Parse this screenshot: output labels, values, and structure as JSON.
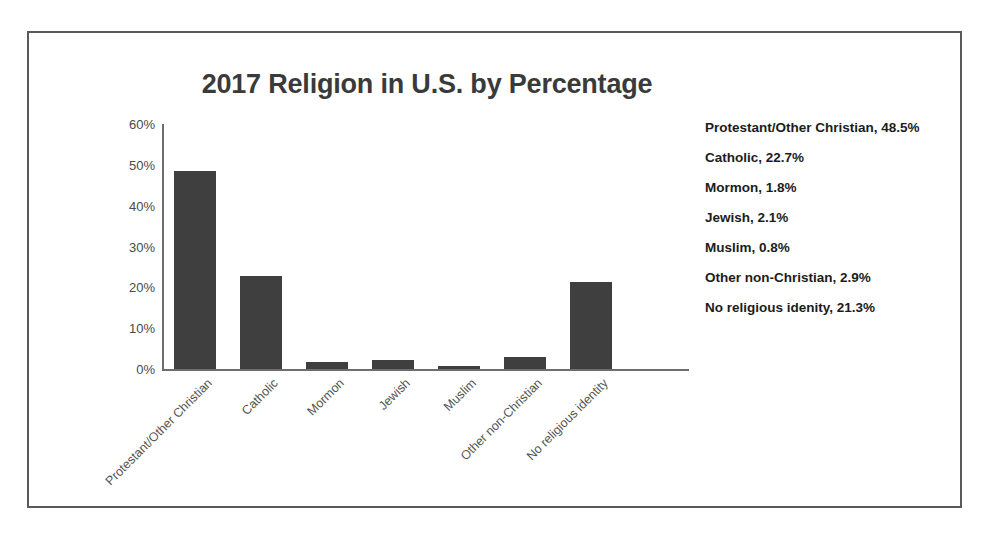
{
  "chart_data": {
    "type": "bar",
    "title": "2017 Religion in U.S. by Percentage",
    "xlabel": "",
    "ylabel": "",
    "ylim": [
      0,
      60
    ],
    "ytick_labels": [
      "60%",
      "50%",
      "40%",
      "30%",
      "20%",
      "10%",
      "0%"
    ],
    "ytick_values": [
      60,
      50,
      40,
      30,
      20,
      10,
      0
    ],
    "grid": false,
    "legend_position": "right",
    "bar_color": "#3f3f3f",
    "axis_color": "#6d6d6d",
    "categories": [
      "Protestant/Other Christian",
      "Catholic",
      "Mormon",
      "Jewish",
      "Muslim",
      "Other non-Christian",
      "No religious identity"
    ],
    "values": [
      48.5,
      22.7,
      1.8,
      2.1,
      0.8,
      2.9,
      21.3
    ],
    "value_suffix": "%"
  },
  "legend": {
    "entries": [
      "Protestant/Other Christian, 48.5%",
      "Catholic, 22.7%",
      "Mormon, 1.8%",
      "Jewish, 2.1%",
      "Muslim, 0.8%",
      "Other non-Christian, 2.9%",
      "No religious idenity, 21.3%"
    ]
  }
}
